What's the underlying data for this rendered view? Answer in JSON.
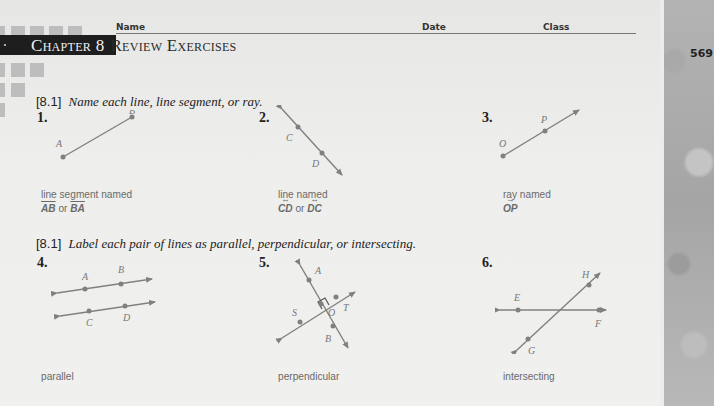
{
  "header": {
    "name_label": "Name",
    "date_label": "Date",
    "class_label": "Class",
    "chapter_label": "Chapter 8",
    "chapter_title": "Review Exercises",
    "page_number": "569"
  },
  "sections": [
    {
      "tag": "[8.1]",
      "instruction": "Name each line, line segment, or ray.",
      "exercises": [
        {
          "number": "1.",
          "figure": "line-segment",
          "points": [
            "A",
            "B"
          ],
          "answer_prefix": "line segment named",
          "answer_a": "AB",
          "answer_join": "or",
          "answer_b": "BA"
        },
        {
          "number": "2.",
          "figure": "line",
          "points": [
            "C",
            "D"
          ],
          "answer_prefix": "line named",
          "answer_a": "CD",
          "answer_join": "or",
          "answer_b": "DC"
        },
        {
          "number": "3.",
          "figure": "ray",
          "points": [
            "O",
            "P"
          ],
          "answer_prefix": "ray named",
          "answer_a": "OP"
        }
      ]
    },
    {
      "tag": "[8.1]",
      "instruction": "Label each pair of lines as parallel, perpendicular, or intersecting.",
      "exercises": [
        {
          "number": "4.",
          "figure": "parallel-lines",
          "points": [
            "A",
            "B",
            "C",
            "D"
          ],
          "answer": "parallel"
        },
        {
          "number": "5.",
          "figure": "perpendicular-lines",
          "points": [
            "A",
            "B",
            "S",
            "T",
            "O"
          ],
          "answer": "perpendicular"
        },
        {
          "number": "6.",
          "figure": "intersecting-lines",
          "points": [
            "E",
            "F",
            "G",
            "H"
          ],
          "answer": "intersecting"
        }
      ]
    }
  ],
  "colors": {
    "figure_line": "#808080",
    "answer_text": "#6a6a6a",
    "chapter_bar": "#1e1e1e"
  }
}
